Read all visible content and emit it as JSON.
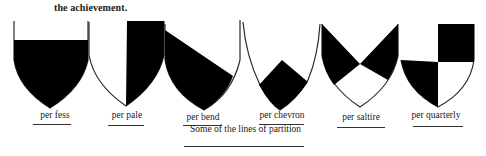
{
  "intro_text": "the achievement.",
  "caption": "Some of the lines of partition",
  "colors": {
    "ink": "#000000",
    "paper": "#ffffff",
    "outline": "#2a2a2a"
  },
  "shields": [
    {
      "id": "per-fess",
      "label": "per fess"
    },
    {
      "id": "per-pale",
      "label": "per pale"
    },
    {
      "id": "per-bend",
      "label": "per bend"
    },
    {
      "id": "per-chevron",
      "label": "per chevron"
    },
    {
      "id": "per-saltire",
      "label": "per saltire"
    },
    {
      "id": "per-quarterly",
      "label": "per quarterly"
    }
  ]
}
